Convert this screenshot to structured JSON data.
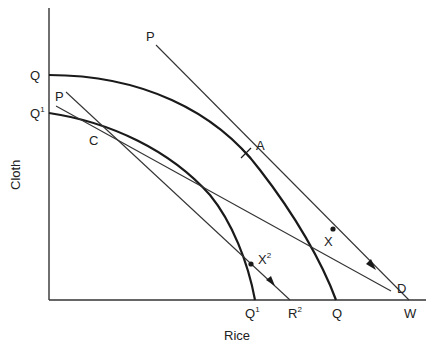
{
  "diagram": {
    "title": "",
    "axes": {
      "y_label": "Cloth",
      "x_label": "Rice"
    },
    "y_intercept_labels": [
      {
        "id": "Q",
        "text": "Q",
        "sup": ""
      },
      {
        "id": "Q1",
        "text": "Q",
        "sup": "1"
      }
    ],
    "x_intercept_labels": [
      {
        "id": "Q1",
        "text": "Q",
        "sup": "1"
      },
      {
        "id": "R2",
        "text": "R",
        "sup": "2"
      },
      {
        "id": "Q",
        "text": "Q",
        "sup": ""
      },
      {
        "id": "W",
        "text": "W",
        "sup": ""
      }
    ],
    "curves": [
      {
        "id": "outer-ppf",
        "label": "Q",
        "description": "Outer production possibility frontier from Q (Cloth axis) to Q (Rice axis)"
      },
      {
        "id": "inner-ppf",
        "label": "Q1",
        "description": "Inner production possibility frontier from Q1 (Cloth axis) to Q1 (Rice axis)"
      }
    ],
    "lines": [
      {
        "id": "price-line-upper",
        "start_label": "P",
        "end_label": "W",
        "description": "Price line tangent to outer PPF at A, ending at W with arrow"
      },
      {
        "id": "price-line-lower",
        "start_label": "P",
        "end_label": "R2",
        "description": "Price line tangent to inner PPF at C, ending at R2 with arrow"
      },
      {
        "id": "line-cd",
        "start_label": "",
        "end_label": "D",
        "description": "Line through C extending to D"
      }
    ],
    "points": [
      {
        "id": "A",
        "text": "A",
        "sup": "",
        "marker": "cross"
      },
      {
        "id": "C",
        "text": "C",
        "sup": "",
        "marker": "none"
      },
      {
        "id": "X",
        "text": "X",
        "sup": "",
        "marker": "dot"
      },
      {
        "id": "X2",
        "text": "X",
        "sup": "2",
        "marker": "dot"
      }
    ],
    "line_labels": {
      "P_upper": "P",
      "P_lower": "P",
      "D": "D"
    },
    "colors": {
      "ink": "#1a1a1a",
      "background": "#ffffff"
    }
  }
}
